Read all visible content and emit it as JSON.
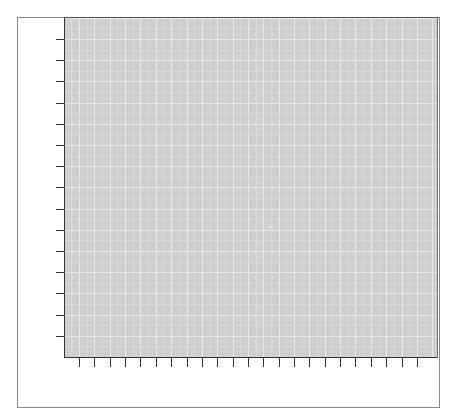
{
  "chart_data": {
    "type": "scatter",
    "title": "",
    "xlabel": "",
    "ylabel": "",
    "x_tick_labels": [],
    "y_tick_labels": [],
    "x_tick_count": 23,
    "y_tick_count": 15,
    "grid": true,
    "minor_grid": true,
    "legend": null,
    "points": [
      {
        "x_px": 269,
        "y_px": 226
      }
    ],
    "colors": {
      "panel_background": "#cfcfcf",
      "major_grid": "#e8e8e8",
      "minor_grid": "#dbdbdb",
      "axis": "#333333",
      "frame": "#8a8a8a"
    }
  }
}
